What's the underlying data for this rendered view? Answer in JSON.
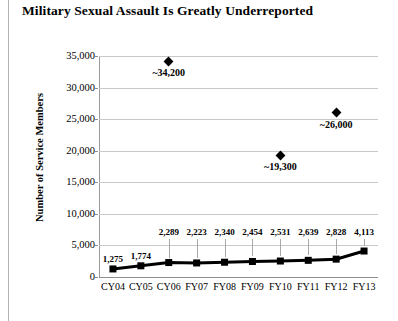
{
  "chart_data": {
    "type": "line",
    "title": "Military Sexual Assault Is Greatly Underreported",
    "xlabel": "",
    "ylabel": "Number of Service Members",
    "ylim": [
      0,
      35000
    ],
    "ytick_labels": [
      "35,000",
      "30,000",
      "25,000",
      "20,000",
      "15,000",
      "10,000",
      "5,000",
      "0"
    ],
    "ytick_values": [
      35000,
      30000,
      25000,
      20000,
      15000,
      10000,
      5000,
      0
    ],
    "grid": true,
    "legend": "none",
    "categories": [
      "CY04",
      "CY05",
      "CY06",
      "FY07",
      "FY08",
      "FY09",
      "FY10",
      "FY11",
      "FY12",
      "FY13"
    ],
    "series": [
      {
        "name": "Reported assaults",
        "marker": "square",
        "values": [
          1275,
          1774,
          2289,
          2223,
          2340,
          2454,
          2531,
          2639,
          2828,
          4113
        ],
        "labels": [
          "1,275",
          "1,774",
          "2,289",
          "2,223",
          "2,340",
          "2,454",
          "2,531",
          "2,639",
          "2,828",
          "4,113"
        ]
      }
    ],
    "annotations": [
      {
        "category": "CY06",
        "value": 34200,
        "label": "~34,200",
        "marker": "diamond"
      },
      {
        "category": "FY10",
        "value": 19300,
        "label": "~19,300",
        "marker": "diamond"
      },
      {
        "category": "FY12",
        "value": 26000,
        "label": "~26,000",
        "marker": "diamond"
      }
    ]
  }
}
